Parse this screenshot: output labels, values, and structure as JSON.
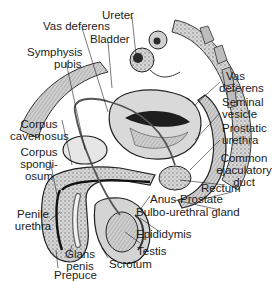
{
  "diagram": {
    "type": "anatomical-sagittal-section",
    "colors": {
      "background": "#ffffff",
      "ink": "#1c1c1c",
      "tissue": "#b9b9b9",
      "tissue_light": "#dcdcdc",
      "tissue_dark": "#6e6e6e"
    },
    "labels": {
      "ureter": "Ureter",
      "vas_deferens_left": "Vas deferens",
      "bladder": "Bladder",
      "symphysis_pubis_1": "Symphysis",
      "symphysis_pubis_2": "pubis",
      "vas_deferens_right_1": "Vas",
      "vas_deferens_right_2": "deferens",
      "seminal_vesicle_1": "Seminal",
      "seminal_vesicle_2": "vesicle",
      "prostatic_urethra_1": "Prostatic",
      "prostatic_urethra_2": "urethra",
      "corpus_cavernosus_1": "Corpus",
      "corpus_cavernosus_2": "cavernosus",
      "corpus_spongiosum_1": "Corpus",
      "corpus_spongiosum_2": "spongi-",
      "corpus_spongiosum_3": "osum",
      "common_ejaculatory_duct_1": "Common",
      "common_ejaculatory_duct_2": "ejaculatory",
      "common_ejaculatory_duct_3": "duct",
      "rectum": "Rectum",
      "anus": "Anus",
      "prostate": "Prostate",
      "bulbo_urethral_gland": "Bulbo-urethral gland",
      "penile_urethra_1": "Penile",
      "penile_urethra_2": "urethra",
      "epididymis": "Epididymis",
      "glans_penis_1": "Glans",
      "glans_penis_2": "penis",
      "testis": "Testis",
      "scrotum": "Scrotum",
      "prepuce": "Prepuce"
    }
  }
}
